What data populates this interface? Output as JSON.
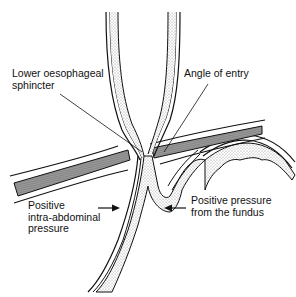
{
  "figure": {
    "type": "anatomical line diagram",
    "colors": {
      "outline": "#111111",
      "mucosa_stipple": "#d9d9d9",
      "diaphragm_fill": "#8c8c8c",
      "background": "#ffffff"
    }
  },
  "labels": {
    "les": {
      "lines": [
        "Lower oesophageal",
        "sphincter"
      ]
    },
    "angle": {
      "lines": [
        "Angle of entry"
      ]
    },
    "iap": {
      "lines": [
        "Positive",
        "intra-abdominal",
        "pressure"
      ]
    },
    "fundus": {
      "lines": [
        "Positive pressure",
        "from the fundus"
      ]
    }
  },
  "arrows": {
    "iap_arrow": {
      "direction": "right"
    },
    "fundus_arrow": {
      "direction": "left"
    }
  }
}
